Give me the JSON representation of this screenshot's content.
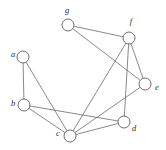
{
  "figure": {
    "width": 166,
    "height": 150,
    "background": "#ffffff",
    "edge_color": "#6b6b6b",
    "node_stroke_color": "#5f5f5f",
    "node_fill_color": "#ffffff",
    "label_color": "#2e2e2e",
    "node_radius": 6
  },
  "chart_data": {
    "type": "diagram",
    "title": "",
    "nodes": [
      {
        "id": "a",
        "label": "a",
        "x": 23,
        "y": 57,
        "label_x": 13,
        "label_y": 55
      },
      {
        "id": "b",
        "label": "b",
        "x": 24,
        "y": 105,
        "label_x": 13,
        "label_y": 104
      },
      {
        "id": "c",
        "label": "c",
        "x": 70,
        "y": 136,
        "label_x": 58,
        "label_y": 134
      },
      {
        "id": "d",
        "label": "d",
        "x": 124,
        "y": 122,
        "label_x": 134,
        "label_y": 129
      },
      {
        "id": "e",
        "label": "e",
        "x": 145,
        "y": 84,
        "label_x": 157,
        "label_y": 88
      },
      {
        "id": "f",
        "label": "f",
        "x": 129,
        "y": 38,
        "label_x": 131,
        "label_y": 22
      },
      {
        "id": "g",
        "label": "g",
        "x": 68,
        "y": 25,
        "label_x": 67,
        "label_y": 11
      }
    ],
    "edges": [
      {
        "source": "a",
        "target": "b"
      },
      {
        "source": "a",
        "target": "c"
      },
      {
        "source": "b",
        "target": "c"
      },
      {
        "source": "b",
        "target": "d"
      },
      {
        "source": "c",
        "target": "d"
      },
      {
        "source": "c",
        "target": "e"
      },
      {
        "source": "c",
        "target": "f"
      },
      {
        "source": "d",
        "target": "f"
      },
      {
        "source": "e",
        "target": "f"
      },
      {
        "source": "e",
        "target": "g"
      },
      {
        "source": "f",
        "target": "g"
      }
    ]
  }
}
